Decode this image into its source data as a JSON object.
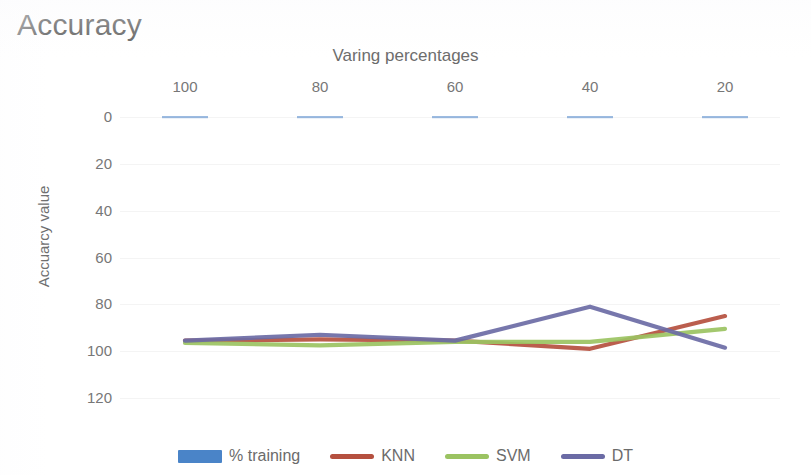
{
  "page": {
    "heading": "Accuracy"
  },
  "chart_data": {
    "type": "line",
    "title": "Varing percentages",
    "xlabel": "",
    "ylabel": "Accuarcy value",
    "x": [
      100,
      80,
      60,
      40,
      20
    ],
    "categories": [
      "100",
      "80",
      "60",
      "40",
      "20"
    ],
    "x_tick_labels": [
      "100",
      "80",
      "60",
      "40",
      "20"
    ],
    "y_tick_labels": [
      "0",
      "20",
      "40",
      "60",
      "80",
      "100",
      "120"
    ],
    "y_ticks": [
      0,
      20,
      40,
      60,
      80,
      100,
      120
    ],
    "ylim": [
      0,
      120
    ],
    "y_axis_inverted": true,
    "x_axis_reversed": true,
    "grid": true,
    "legend_position": "bottom",
    "series": [
      {
        "name": "% training",
        "color": "#4A84C8",
        "marker_style": "bar",
        "values": [
          0,
          0,
          0,
          0,
          0
        ]
      },
      {
        "name": "KNN",
        "color": "#B5503F",
        "marker_style": "line",
        "values": [
          95.5,
          95.0,
          95.5,
          99.0,
          85.0
        ]
      },
      {
        "name": "SVM",
        "color": "#9BC362",
        "marker_style": "line",
        "values": [
          96.5,
          97.5,
          96.0,
          96.0,
          90.5
        ]
      },
      {
        "name": "DT",
        "color": "#6B6BA5",
        "marker_style": "line",
        "values": [
          95.5,
          93.0,
          95.5,
          81.0,
          98.5
        ]
      }
    ],
    "legend_entries": [
      {
        "label": "% training",
        "color": "#4A84C8",
        "style": "bar"
      },
      {
        "label": "KNN",
        "color": "#B5503F",
        "style": "line"
      },
      {
        "label": "SVM",
        "color": "#9BC362",
        "style": "line"
      },
      {
        "label": "DT",
        "color": "#6B6BA5",
        "style": "line"
      }
    ],
    "colors": {
      "training": "#4A84C8",
      "knn": "#B5503F",
      "svm": "#9BC362",
      "dt": "#6B6BA5",
      "grid": "#F4F4F4",
      "text": "#777777"
    }
  }
}
